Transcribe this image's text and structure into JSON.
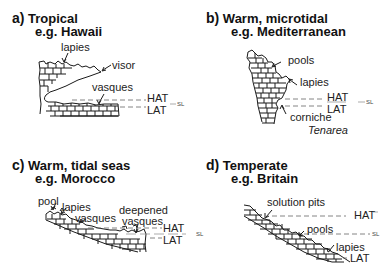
{
  "panels": [
    {
      "letter": "a)",
      "title": "Tropical",
      "subtitle": "e.g. Hawaii",
      "labels": [
        "lapies",
        "visor",
        "vasques"
      ],
      "levels": {
        "hat": "HAT",
        "lat": "LAT",
        "sl": "SL"
      }
    },
    {
      "letter": "b)",
      "title": "Warm, microtidal",
      "subtitle": "e.g. Mediterranean",
      "labels": [
        "pools",
        "lapies",
        "corniche"
      ],
      "species": "Tenarea",
      "levels": {
        "hat": "HAT",
        "lat": "LAT",
        "sl": "SL"
      }
    },
    {
      "letter": "c)",
      "title": "Warm, tidal seas",
      "subtitle": "e.g. Morocco",
      "labels": [
        "pool",
        "lapies",
        "vasques",
        "deepened",
        "vasques"
      ],
      "levels": {
        "hat": "HAT",
        "lat": "LAT",
        "sl": "SL"
      }
    },
    {
      "letter": "d)",
      "title": "Temperate",
      "subtitle": "e.g. Britain",
      "labels": [
        "solution pits",
        "pools",
        "lapies"
      ],
      "levels": {
        "hat": "HAT",
        "lat": "LAT",
        "sl": "SL"
      }
    }
  ],
  "colors": {
    "ink": "#1a1a1a",
    "dash": "#666666",
    "background": "#ffffff"
  }
}
